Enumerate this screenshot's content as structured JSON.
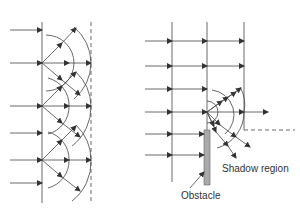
{
  "figure": {
    "panels": [
      {
        "id": "left",
        "description": "Huygens wavelet construction: plane wave with secondary wavelets forming new wavefront"
      },
      {
        "id": "right",
        "description": "Diffraction of plane wave at edge of obstacle, waves bending into shadow region"
      }
    ],
    "labels": {
      "shadow_region": "Shadow region",
      "obstacle": "Obstacle"
    },
    "colors": {
      "line": "#333333",
      "obstacle_fill": "#aaaaaa",
      "background": "#ffffff"
    }
  }
}
